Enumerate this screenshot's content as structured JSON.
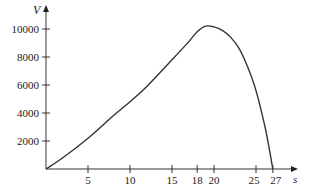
{
  "chart_data": {
    "type": "line",
    "title": "",
    "xlabel": "s",
    "ylabel": "V",
    "xlim": [
      0,
      29
    ],
    "ylim": [
      0,
      11500
    ],
    "grid": false,
    "legend": null,
    "x_ticks": [
      5,
      10,
      15,
      18,
      20,
      25,
      27
    ],
    "x_tick_labels": [
      "5",
      "10",
      "15",
      "18",
      "20",
      "25",
      "27"
    ],
    "y_ticks": [
      2000,
      4000,
      6000,
      8000,
      10000
    ],
    "y_tick_labels": [
      "2000",
      "4000",
      "6000",
      "8000",
      "10000"
    ],
    "series": [
      {
        "name": "V(s)",
        "color": "#333333",
        "x": [
          0,
          2,
          5,
          8,
          10,
          12,
          15,
          17,
          18,
          19,
          20,
          21,
          22,
          23,
          24,
          25,
          26,
          26.5,
          27
        ],
        "values": [
          0,
          800,
          2200,
          3800,
          4800,
          5900,
          7800,
          9100,
          9800,
          10200,
          10150,
          9900,
          9400,
          8600,
          7300,
          5600,
          3200,
          1700,
          0
        ]
      }
    ]
  }
}
